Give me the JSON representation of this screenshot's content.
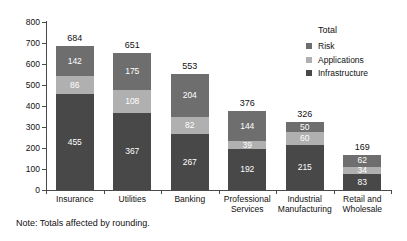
{
  "chart_data": {
    "type": "bar",
    "subtype": "stacked-vertical",
    "title": "",
    "xlabel": "",
    "ylabel": "",
    "ylim": [
      0,
      800
    ],
    "ytick_step": 100,
    "yticks": [
      "800",
      "700",
      "600",
      "500",
      "400",
      "300",
      "200",
      "100",
      "0"
    ],
    "grid": false,
    "legend_position": "top-right",
    "legend_title": "Total",
    "categories": [
      "Insurance",
      "Utilities",
      "Banking",
      "Professional Services",
      "Industrial Manufacturing",
      "Retail and Wholesale"
    ],
    "category_lines": [
      [
        "Insurance"
      ],
      [
        "Utilities"
      ],
      [
        "Banking"
      ],
      [
        "Professional",
        "Services"
      ],
      [
        "Industrial",
        "Manufacturing"
      ],
      [
        "Retail and",
        "Wholesale"
      ]
    ],
    "series": [
      {
        "name": "Infrastructure",
        "color": "#484848",
        "values": [
          455,
          367,
          267,
          192,
          215,
          83
        ]
      },
      {
        "name": "Applications",
        "color": "#b0b0b0",
        "values": [
          86,
          108,
          82,
          39,
          60,
          34
        ]
      },
      {
        "name": "Risk",
        "color": "#6e6e6e",
        "values": [
          142,
          175,
          204,
          144,
          50,
          62
        ]
      }
    ],
    "stack_order_bottom_to_top": [
      "Infrastructure",
      "Applications",
      "Risk"
    ],
    "totals": [
      684,
      651,
      553,
      376,
      326,
      169
    ]
  },
  "legend": {
    "title": "Total",
    "items": [
      {
        "label": "Risk",
        "color": "#6e6e6e"
      },
      {
        "label": "Applications",
        "color": "#b0b0b0"
      },
      {
        "label": "Infrastructure",
        "color": "#484848"
      }
    ]
  },
  "note": {
    "text": "Note: Totals affected by rounding."
  },
  "colors": {
    "risk": "#6e6e6e",
    "applications": "#b0b0b0",
    "infrastructure": "#484848",
    "axis": "#4a4a4a",
    "text": "#111111",
    "background": "#ffffff"
  }
}
